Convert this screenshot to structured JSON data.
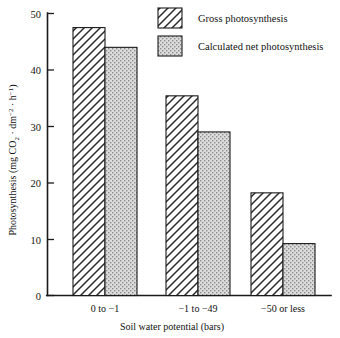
{
  "chart_data": {
    "type": "bar",
    "title": "",
    "xlabel": "Soil water potential (bars)",
    "ylabel": "Photosynthesis (mg CO2 · dm-2 · h-1)",
    "categories": [
      "0 to −1",
      "−1 to −49",
      "−50 or less"
    ],
    "series": [
      {
        "name": "Gross photosynthesis",
        "values": [
          47.5,
          35.4,
          18.2
        ],
        "fill": "hatch"
      },
      {
        "name": "Calculated net photosynthesis",
        "values": [
          44.0,
          29.0,
          9.2
        ],
        "fill": "stipple"
      }
    ],
    "ylim": [
      0,
      50
    ],
    "yticks": [
      0,
      10,
      20,
      30,
      40,
      50
    ],
    "ytick_labels": [
      "0",
      "10",
      "20",
      "30",
      "40",
      "50"
    ],
    "grid": false,
    "legend_position": "top-right"
  },
  "axes": {
    "y_title_parts": {
      "main": "Photosynthesis (mg CO",
      "sub_2": "2",
      "mid": " · dm",
      "sup_minus2": "−2",
      "mid2": " · h",
      "sup_minus1": "−1",
      "close": ")"
    },
    "x_title": "Soil water potential (bars)"
  },
  "legend": {
    "items": [
      {
        "label": "Gross photosynthesis",
        "pattern": "diagonal-hatch"
      },
      {
        "label": "Calculated net photosynthesis",
        "pattern": "stipple-dots"
      }
    ]
  },
  "colors": {
    "ink": "#1a1a1a",
    "background": "#ffffff",
    "stipple_fill": "#d6d6d6",
    "hatch_fill": "#ffffff"
  }
}
